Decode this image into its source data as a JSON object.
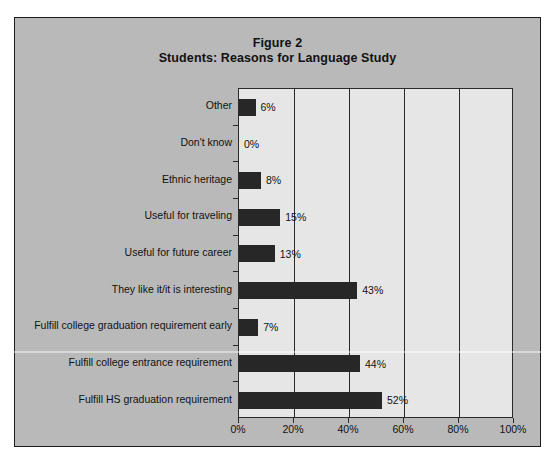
{
  "figure": {
    "title_line1": "Figure 2",
    "title_line2": "Students: Reasons for Language Study",
    "panel_color": "#b9b9b9",
    "plot_color": "#e6e6e6",
    "bar_color": "#272727",
    "axis_color": "#2a2a2a"
  },
  "chart_data": {
    "type": "bar",
    "orientation": "horizontal",
    "title": "Figure 2\nStudents: Reasons for Language Study",
    "xlabel": "",
    "ylabel": "",
    "xlim": [
      0,
      100
    ],
    "xticks": [
      "0%",
      "20%",
      "40%",
      "60%",
      "80%",
      "100%"
    ],
    "xtick_values": [
      0,
      20,
      40,
      60,
      80,
      100
    ],
    "grid": true,
    "grid_axis": "x",
    "legend": false,
    "data_labels": true,
    "categories": [
      "Other",
      "Don't know",
      "Ethnic heritage",
      "Useful for traveling",
      "Useful for future career",
      "They like it/it is interesting",
      "Fulfill college graduation requirement early",
      "Fulfill college entrance requirement",
      "Fulfill HS graduation requirement"
    ],
    "values": [
      6,
      0,
      8,
      15,
      13,
      43,
      7,
      44,
      52
    ],
    "value_labels": [
      "6%",
      "0%",
      "8%",
      "15%",
      "13%",
      "43%",
      "7%",
      "44%",
      "52%"
    ]
  }
}
